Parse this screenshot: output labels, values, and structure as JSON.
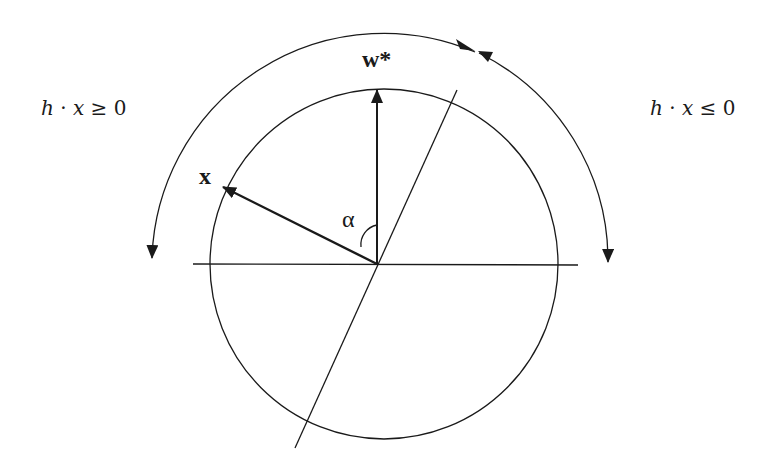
{
  "diagram": {
    "type": "geometric-vector-diagram",
    "labels": {
      "left_region": "h · x ≥ 0",
      "right_region": "h · x ≤ 0",
      "vector_x": "x",
      "vector_w": "w*",
      "angle": "α"
    },
    "left_region_parts": {
      "h": "h",
      "dot": " · ",
      "x": "x",
      "rel": " ≥ ",
      "zero": "0"
    },
    "right_region_parts": {
      "h": "h",
      "dot": " · ",
      "x": "x",
      "rel": " ≤ ",
      "zero": "0"
    },
    "geometry": {
      "center": [
        377,
        264
      ],
      "inner_circle_radius": 175,
      "outer_arc_radius": 232,
      "horizontal_axis": {
        "x1": 193,
        "x2": 578,
        "y": 264
      },
      "tilted_line": {
        "x1": 457,
        "y1": 90,
        "x2": 295,
        "y2": 448
      },
      "vector_w_tip": [
        377,
        89
      ],
      "vector_x_tip": [
        222,
        187
      ]
    },
    "colors": {
      "stroke": "#1a1a1a",
      "background": "#ffffff"
    }
  }
}
